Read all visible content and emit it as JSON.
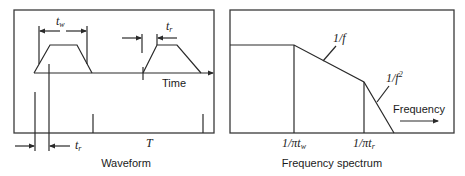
{
  "waveform": {
    "caption": "Waveform",
    "axis_label": "Time",
    "period_label": "T",
    "pulse_width_label": "t",
    "pulse_width_sub": "w",
    "rise_time_label_top": "t",
    "rise_time_sub_top": "r",
    "rise_time_label_bottom": "t",
    "rise_time_sub_bottom": "r"
  },
  "spectrum": {
    "caption": "Frequency spectrum",
    "axis_label": "Frequency",
    "slope1_label": "1/f",
    "slope2_label": "1/f",
    "slope2_exp": "2",
    "break1_prefix": "1/π",
    "break1_var": "t",
    "break1_sub": "w",
    "break2_prefix": "1/π",
    "break2_var": "t",
    "break2_sub": "r"
  }
}
